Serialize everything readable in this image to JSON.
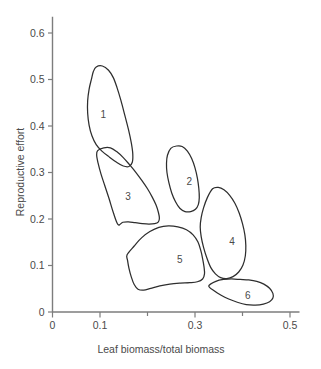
{
  "chart_data": {
    "type": "scatter",
    "title": "",
    "subtitle": "",
    "xlabel": "Leaf biomass/total biomass",
    "ylabel": "Reproductive effort",
    "xlim": [
      0,
      0.52
    ],
    "ylim": [
      0,
      0.635
    ],
    "grid": false,
    "legend_position": "none",
    "annotation_style": "convex-hull-outlines-with-numeric-labels",
    "x_ticks": [
      {
        "value": 0,
        "label": "0",
        "major": true
      },
      {
        "value": 0.1,
        "label": "0.1",
        "major": true
      },
      {
        "value": 0.2,
        "label": "",
        "major": false
      },
      {
        "value": 0.3,
        "label": "0.3",
        "major": true
      },
      {
        "value": 0.4,
        "label": "",
        "major": false
      },
      {
        "value": 0.5,
        "label": "0.5",
        "major": true
      }
    ],
    "y_ticks": [
      {
        "value": 0,
        "label": "0",
        "major": true
      },
      {
        "value": 0.1,
        "label": "0.1",
        "major": true
      },
      {
        "value": 0.2,
        "label": "0.2",
        "major": true
      },
      {
        "value": 0.3,
        "label": "0.3",
        "major": true
      },
      {
        "value": 0.4,
        "label": "0.4",
        "major": true
      },
      {
        "value": 0.5,
        "label": "0.5",
        "major": true
      },
      {
        "value": 0.6,
        "label": "0.6",
        "major": true
      }
    ],
    "groups": [
      {
        "label": "1",
        "label_x": 0.107,
        "label_y": 0.425,
        "outline": [
          [
            0.092,
            0.527
          ],
          [
            0.105,
            0.529
          ],
          [
            0.118,
            0.52
          ],
          [
            0.128,
            0.504
          ],
          [
            0.136,
            0.482
          ],
          [
            0.144,
            0.455
          ],
          [
            0.152,
            0.424
          ],
          [
            0.16,
            0.392
          ],
          [
            0.166,
            0.363
          ],
          [
            0.169,
            0.34
          ],
          [
            0.168,
            0.322
          ],
          [
            0.161,
            0.313
          ],
          [
            0.149,
            0.314
          ],
          [
            0.135,
            0.322
          ],
          [
            0.12,
            0.333
          ],
          [
            0.104,
            0.346
          ],
          [
            0.092,
            0.36
          ],
          [
            0.083,
            0.379
          ],
          [
            0.077,
            0.402
          ],
          [
            0.074,
            0.428
          ],
          [
            0.074,
            0.454
          ],
          [
            0.077,
            0.479
          ],
          [
            0.082,
            0.501
          ],
          [
            0.086,
            0.517
          ]
        ]
      },
      {
        "label": "2",
        "label_x": 0.288,
        "label_y": 0.281,
        "outline": [
          [
            0.249,
            0.352
          ],
          [
            0.261,
            0.357
          ],
          [
            0.273,
            0.356
          ],
          [
            0.284,
            0.346
          ],
          [
            0.293,
            0.33
          ],
          [
            0.3,
            0.31
          ],
          [
            0.305,
            0.288
          ],
          [
            0.308,
            0.266
          ],
          [
            0.309,
            0.246
          ],
          [
            0.307,
            0.231
          ],
          [
            0.301,
            0.221
          ],
          [
            0.291,
            0.216
          ],
          [
            0.279,
            0.216
          ],
          [
            0.268,
            0.223
          ],
          [
            0.259,
            0.237
          ],
          [
            0.251,
            0.256
          ],
          [
            0.245,
            0.278
          ],
          [
            0.241,
            0.3
          ],
          [
            0.24,
            0.32
          ],
          [
            0.242,
            0.337
          ]
        ]
      },
      {
        "label": "3",
        "label_x": 0.159,
        "label_y": 0.248,
        "outline": [
          [
            0.095,
            0.347
          ],
          [
            0.108,
            0.353
          ],
          [
            0.122,
            0.353
          ],
          [
            0.135,
            0.345
          ],
          [
            0.149,
            0.332
          ],
          [
            0.162,
            0.317
          ],
          [
            0.175,
            0.301
          ],
          [
            0.188,
            0.283
          ],
          [
            0.2,
            0.265
          ],
          [
            0.21,
            0.247
          ],
          [
            0.218,
            0.23
          ],
          [
            0.223,
            0.214
          ],
          [
            0.225,
            0.202
          ],
          [
            0.223,
            0.194
          ],
          [
            0.215,
            0.19
          ],
          [
            0.203,
            0.189
          ],
          [
            0.189,
            0.19
          ],
          [
            0.174,
            0.192
          ],
          [
            0.16,
            0.194
          ],
          [
            0.148,
            0.193
          ],
          [
            0.138,
            0.188
          ],
          [
            0.128,
            0.214
          ],
          [
            0.119,
            0.244
          ],
          [
            0.11,
            0.272
          ],
          [
            0.102,
            0.297
          ],
          [
            0.096,
            0.32
          ],
          [
            0.093,
            0.337
          ]
        ]
      },
      {
        "label": "4",
        "label_x": 0.378,
        "label_y": 0.152,
        "outline": [
          [
            0.337,
            0.265
          ],
          [
            0.349,
            0.268
          ],
          [
            0.361,
            0.263
          ],
          [
            0.373,
            0.251
          ],
          [
            0.384,
            0.234
          ],
          [
            0.393,
            0.213
          ],
          [
            0.4,
            0.19
          ],
          [
            0.405,
            0.166
          ],
          [
            0.407,
            0.143
          ],
          [
            0.406,
            0.121
          ],
          [
            0.401,
            0.101
          ],
          [
            0.392,
            0.086
          ],
          [
            0.38,
            0.076
          ],
          [
            0.367,
            0.072
          ],
          [
            0.354,
            0.074
          ],
          [
            0.343,
            0.082
          ],
          [
            0.333,
            0.096
          ],
          [
            0.325,
            0.116
          ],
          [
            0.318,
            0.139
          ],
          [
            0.313,
            0.162
          ],
          [
            0.311,
            0.183
          ],
          [
            0.313,
            0.203
          ],
          [
            0.318,
            0.224
          ],
          [
            0.326,
            0.246
          ]
        ]
      },
      {
        "label": "5",
        "label_x": 0.268,
        "label_y": 0.113,
        "outline": [
          [
            0.157,
            0.123
          ],
          [
            0.172,
            0.142
          ],
          [
            0.188,
            0.16
          ],
          [
            0.205,
            0.173
          ],
          [
            0.224,
            0.182
          ],
          [
            0.244,
            0.185
          ],
          [
            0.264,
            0.183
          ],
          [
            0.282,
            0.177
          ],
          [
            0.296,
            0.166
          ],
          [
            0.306,
            0.151
          ],
          [
            0.312,
            0.133
          ],
          [
            0.316,
            0.115
          ],
          [
            0.319,
            0.097
          ],
          [
            0.32,
            0.082
          ],
          [
            0.316,
            0.071
          ],
          [
            0.305,
            0.065
          ],
          [
            0.289,
            0.063
          ],
          [
            0.269,
            0.062
          ],
          [
            0.247,
            0.06
          ],
          [
            0.226,
            0.056
          ],
          [
            0.207,
            0.051
          ],
          [
            0.192,
            0.047
          ],
          [
            0.18,
            0.049
          ],
          [
            0.172,
            0.059
          ],
          [
            0.166,
            0.075
          ],
          [
            0.161,
            0.094
          ],
          [
            0.158,
            0.111
          ]
        ]
      },
      {
        "label": "6",
        "label_x": 0.411,
        "label_y": 0.035,
        "outline": [
          [
            0.329,
            0.056
          ],
          [
            0.344,
            0.066
          ],
          [
            0.36,
            0.07
          ],
          [
            0.377,
            0.071
          ],
          [
            0.395,
            0.07
          ],
          [
            0.413,
            0.069
          ],
          [
            0.43,
            0.066
          ],
          [
            0.445,
            0.06
          ],
          [
            0.457,
            0.051
          ],
          [
            0.464,
            0.04
          ],
          [
            0.464,
            0.03
          ],
          [
            0.457,
            0.022
          ],
          [
            0.444,
            0.017
          ],
          [
            0.427,
            0.015
          ],
          [
            0.408,
            0.016
          ],
          [
            0.389,
            0.021
          ],
          [
            0.371,
            0.028
          ],
          [
            0.355,
            0.036
          ],
          [
            0.341,
            0.045
          ]
        ]
      }
    ]
  }
}
